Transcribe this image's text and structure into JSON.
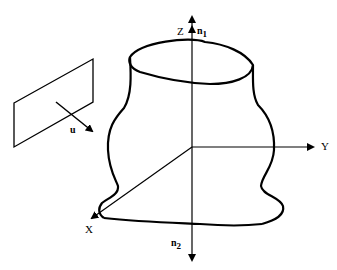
{
  "diagram": {
    "type": "3d-surface-with-projection-plane",
    "axes": {
      "x": {
        "label": "X"
      },
      "y": {
        "label": "Y"
      },
      "z": {
        "label": "Z"
      }
    },
    "normals": {
      "n1": {
        "label": "n",
        "subscript": "1"
      },
      "n2": {
        "label": "n",
        "subscript": "2"
      }
    },
    "view_vector": {
      "label": "u"
    },
    "colors": {
      "stroke": "#000000",
      "background": "#ffffff"
    }
  }
}
